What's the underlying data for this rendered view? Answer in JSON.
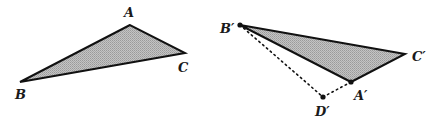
{
  "figure": {
    "colors": {
      "fill": "#b5b5b5",
      "stroke": "#111111",
      "background": "#ffffff"
    },
    "left_triangle": {
      "name": "ABC",
      "vertices": {
        "A": {
          "x": 130,
          "y": 25,
          "label": "A"
        },
        "B": {
          "x": 20,
          "y": 82,
          "label": "B"
        },
        "C": {
          "x": 185,
          "y": 53,
          "label": "C"
        }
      }
    },
    "right_triangle": {
      "name": "A'B'C'",
      "vertices": {
        "A'": {
          "x": 351,
          "y": 82,
          "label": "A′"
        },
        "B'": {
          "x": 240,
          "y": 25,
          "label": "B′"
        },
        "C'": {
          "x": 405,
          "y": 54,
          "label": "C′"
        }
      },
      "extra_point": {
        "D'": {
          "x": 323,
          "y": 97,
          "label": "D′"
        }
      },
      "dotted_segments": [
        "B'D'",
        "D'A'"
      ]
    }
  }
}
